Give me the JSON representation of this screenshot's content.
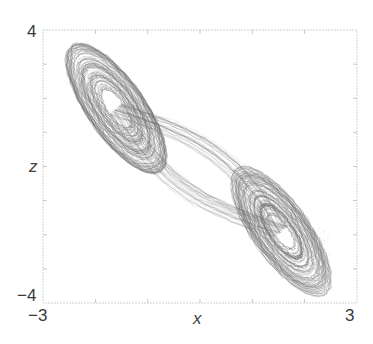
{
  "chart_data": {
    "type": "scatter",
    "title": "",
    "xlabel": "x",
    "ylabel": "z",
    "xlim": [
      -3,
      3
    ],
    "ylim": [
      -4,
      4
    ],
    "x_tick_labels": [
      "−3",
      "3"
    ],
    "y_tick_labels": [
      "4",
      "−4"
    ],
    "grid": false,
    "legend": null,
    "lobes": [
      {
        "name": "upper-left",
        "center": [
          -1.6,
          1.7
        ],
        "semi_major": 2.1,
        "semi_minor": 0.75,
        "angle_deg": -58,
        "hole": [
          0.45,
          0.12
        ]
      },
      {
        "name": "lower-right",
        "center": [
          1.55,
          -1.9
        ],
        "semi_major": 2.1,
        "semi_minor": 0.75,
        "angle_deg": -58,
        "hole": [
          0.4,
          0.12
        ]
      }
    ],
    "extent": {
      "x": [
        -2.2,
        2.1
      ],
      "z": [
        -3.3,
        3.1
      ]
    },
    "color": "#6e6e6e"
  },
  "axes": {
    "x_min_label": "−3",
    "x_max_label": "3",
    "z_max_label": "4",
    "z_min_label": "−4",
    "x_label": "x",
    "z_label": "z"
  }
}
